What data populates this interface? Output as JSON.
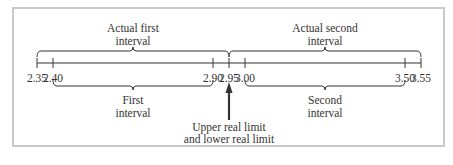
{
  "diagram": {
    "number_line": {
      "min": 2.35,
      "max": 3.55,
      "ticks": [
        {
          "value": 2.35,
          "label": "2.35"
        },
        {
          "value": 2.4,
          "label": "2.40"
        },
        {
          "value": 2.9,
          "label": "2.90"
        },
        {
          "value": 2.95,
          "label": "2.95"
        },
        {
          "value": 3.0,
          "label": "3.00"
        },
        {
          "value": 3.5,
          "label": "3.50"
        },
        {
          "value": 3.55,
          "label": "3.55"
        }
      ]
    },
    "braces": [
      {
        "id": "actual-first",
        "from": 2.35,
        "to": 2.95,
        "side": "above",
        "label_lines": [
          "Actual first",
          "interval"
        ]
      },
      {
        "id": "actual-second",
        "from": 2.95,
        "to": 3.55,
        "side": "above",
        "label_lines": [
          "Actual second",
          "interval"
        ]
      },
      {
        "id": "first",
        "from": 2.4,
        "to": 2.9,
        "side": "below",
        "label_lines": [
          "First",
          "interval"
        ]
      },
      {
        "id": "second",
        "from": 3.0,
        "to": 3.5,
        "side": "below",
        "label_lines": [
          "Second",
          "interval"
        ]
      }
    ],
    "arrow": {
      "at": 2.95,
      "label_lines": [
        "Upper real limit",
        "and lower real limit"
      ]
    },
    "colors": {
      "ink": "#333333",
      "frame": "#c9c9c9"
    }
  }
}
